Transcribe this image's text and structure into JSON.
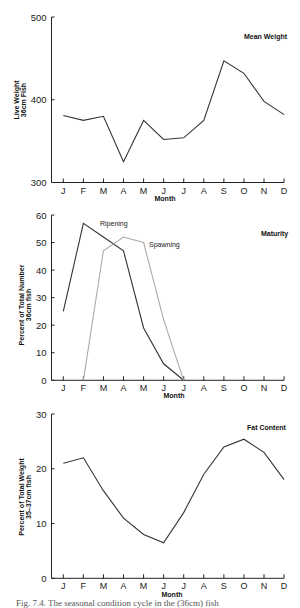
{
  "chart_data": [
    {
      "type": "line",
      "title": "Mean Weight",
      "xlabel": "Month",
      "ylabel": [
        "Live Weight",
        "36cm Fish"
      ],
      "categories": [
        "J",
        "F",
        "M",
        "A",
        "M",
        "J",
        "J",
        "A",
        "S",
        "O",
        "N",
        "D"
      ],
      "yticks": [
        300,
        400,
        500
      ],
      "ylim": [
        300,
        500
      ],
      "grid": false,
      "series": [
        {
          "name": "Mean Weight",
          "color": "#333333",
          "values": [
            381,
            375,
            380,
            325,
            375,
            352,
            354,
            375,
            447,
            432,
            398,
            382
          ]
        }
      ]
    },
    {
      "type": "line",
      "title": "Maturity",
      "xlabel": "Month",
      "ylabel": [
        "Percent of Total Number",
        "36cm fish"
      ],
      "categories": [
        "J",
        "F",
        "M",
        "A",
        "M",
        "J",
        "J",
        "A",
        "S",
        "O",
        "N",
        "D"
      ],
      "yticks": [
        0,
        10,
        20,
        30,
        40,
        50,
        60
      ],
      "ylim": [
        0,
        60
      ],
      "grid": false,
      "series": [
        {
          "name": "Ripening",
          "color": "#333333",
          "values": [
            25,
            57,
            52,
            47,
            19,
            6,
            0,
            null,
            null,
            null,
            null,
            null
          ]
        },
        {
          "name": "Spawning",
          "color": "#aaaaaa",
          "values": [
            null,
            0,
            47,
            52,
            50,
            22,
            0,
            null,
            null,
            null,
            null,
            null
          ]
        }
      ]
    },
    {
      "type": "line",
      "title": "Fat Content",
      "xlabel": "Month",
      "ylabel": [
        "Percent of Total Weight",
        "35–37cm fish"
      ],
      "categories": [
        "J",
        "F",
        "M",
        "A",
        "M",
        "J",
        "J",
        "A",
        "S",
        "O",
        "N",
        "D"
      ],
      "yticks": [
        0,
        10,
        20,
        30
      ],
      "ylim": [
        0,
        30
      ],
      "grid": false,
      "series": [
        {
          "name": "Fat Content",
          "color": "#333333",
          "values": [
            21,
            22,
            16,
            11,
            8,
            6.5,
            12,
            19,
            24,
            25.4,
            23,
            18
          ]
        }
      ]
    }
  ],
  "labels": {
    "chart1": {
      "title": "Mean Weight",
      "ylabel1": "Live Weight",
      "ylabel2": "36cm Fish",
      "xlabel": "Month"
    },
    "chart2": {
      "title": "Maturity",
      "ylabel1": "Percent of Total Number",
      "ylabel2": "36cm fish",
      "xlabel": "Month",
      "series1": "Ripening",
      "series2": "Spawning"
    },
    "chart3": {
      "title": "Fat Content",
      "ylabel1": "Percent of Total Weight",
      "ylabel2": "35–37cm fish",
      "xlabel": "Month"
    }
  },
  "caption": "Fig. 7.4.  The seasonal condition cycle in the (36cm) fish"
}
